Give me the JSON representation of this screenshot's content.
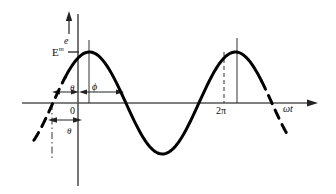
{
  "figure": {
    "name": "sinusoidal-waveform-phase-diagram",
    "labels": {
      "y_axis": "e",
      "amplitude": "E",
      "amplitude_sup": "m",
      "phase_offset_top": "θ",
      "phi": "ϕ",
      "origin": "0",
      "theta": "θ",
      "two_pi": "2π",
      "x_axis": "ωt"
    },
    "colors": {
      "curve": "#000000",
      "axis": "#444444",
      "guide": "#333333",
      "background": "#ffffff"
    }
  },
  "chart_data": {
    "type": "line",
    "title": "",
    "xlabel": "ωt",
    "ylabel": "e",
    "xlim": [
      -1.57,
      9.42
    ],
    "ylim": [
      -1.25,
      1.4
    ],
    "grid": false,
    "legend": null,
    "annotations": [
      {
        "text": "E",
        "superscript": "m",
        "role": "peak-amplitude-tick",
        "y_value": 1.0
      },
      {
        "text": "θ",
        "role": "phase-lead-angle-above-axis"
      },
      {
        "text": "ϕ",
        "role": "phase-angle-from-origin-to-peak"
      },
      {
        "text": "0",
        "role": "origin-label",
        "x_value": 0
      },
      {
        "text": "θ",
        "role": "phase-lead-angle-below-axis"
      },
      {
        "text": "2π",
        "role": "x-tick-label",
        "x_value": 6.283
      },
      {
        "text": "ωt",
        "role": "x-axis-arrow-label"
      }
    ],
    "series": [
      {
        "name": "e = E^m sin(ωt + θ)",
        "style_solid_range": [
          -0.55,
          7.9
        ],
        "style_dashed_ranges": [
          [
            -1.9,
            -0.55
          ],
          [
            7.9,
            9.0
          ]
        ],
        "amplitude": 1.0,
        "phase_shift_radians": 1.08,
        "period_radians": 6.283,
        "x": [
          -1.9,
          -1.6,
          -1.3,
          -1.0,
          -0.7,
          -0.4,
          -0.1,
          0.2,
          0.49,
          0.79,
          1.09,
          1.39,
          1.68,
          1.98,
          2.28,
          2.58,
          2.88,
          3.17,
          3.47,
          3.77,
          4.07,
          4.36,
          4.66,
          4.96,
          5.26,
          5.55,
          5.85,
          6.15,
          6.45,
          6.75,
          7.04,
          7.34,
          7.64,
          7.94,
          8.23,
          8.53,
          8.83,
          9.0
        ],
        "y": [
          -0.71,
          -0.47,
          -0.2,
          0.08,
          0.36,
          0.6,
          0.8,
          0.94,
          1.0,
          0.99,
          0.89,
          0.73,
          0.51,
          0.25,
          -0.03,
          -0.31,
          -0.56,
          -0.77,
          -0.92,
          -0.99,
          -1.0,
          -0.93,
          -0.79,
          -0.59,
          -0.35,
          -0.08,
          0.2,
          0.46,
          0.68,
          0.86,
          0.97,
          1.0,
          0.95,
          0.83,
          0.63,
          0.39,
          0.11,
          -0.06
        ]
      }
    ],
    "guide_lines": [
      {
        "role": "peak-1-vertical",
        "x_value": 0.49,
        "style": "solid"
      },
      {
        "role": "peak-2-vertical",
        "x_value": 6.77,
        "style": "solid"
      },
      {
        "role": "two-pi-vertical",
        "x_value": 6.283,
        "style": "dashed"
      },
      {
        "role": "zero-crossing-vertical",
        "x_value": -1.08,
        "style": "dash-dot"
      }
    ],
    "dimension_arrows": [
      {
        "role": "theta-above-axis",
        "from_x": -1.08,
        "to_x": 0.0
      },
      {
        "role": "phi-from-origin-to-peak",
        "from_x": 0.0,
        "to_x": 1.45
      },
      {
        "role": "theta-below-axis",
        "from_x": -1.08,
        "to_x": 0.0
      }
    ]
  }
}
